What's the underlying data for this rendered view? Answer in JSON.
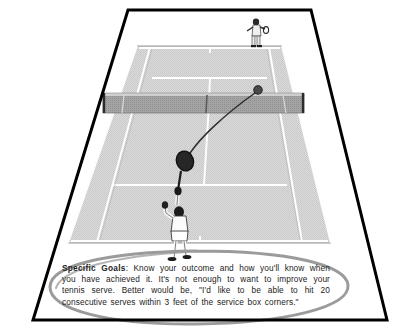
{
  "figure": {
    "kind": "line-art-illustration",
    "background_color": "#ffffff",
    "frame": {
      "shape": "trapezoid-border",
      "color": "#000000",
      "stroke_width": 3
    }
  },
  "court": {
    "surface_color": "#d9d9d9",
    "line_color": "#ffffff",
    "outline_color": "#8c8c8c",
    "net": {
      "name": "tennis-net",
      "band_color": "#9a9a9a",
      "post_color": "#2b2b2b"
    }
  },
  "players": {
    "near": {
      "label": "serving-player",
      "pose": "overhead-serve",
      "skin_color": "#1c1c1c",
      "clothing_color": "#ffffff",
      "racket_color": "#1a1a1a"
    },
    "far": {
      "label": "receiving-player",
      "pose": "standing-ready",
      "clothing_color": "#f0f0f0"
    }
  },
  "ball": {
    "label": "tennis-ball",
    "color": "#3a3a3a",
    "trajectory": "arc-from-racket-over-net"
  },
  "annotation": {
    "ellipse": {
      "label": "hand-drawn-highlight-ellipse",
      "color": "#9e9e9e",
      "stroke_width": 3
    }
  },
  "caption": {
    "lead_label": "Specific Goals",
    "separator": ": ",
    "body": "Know your outcome and how you'll know when you have achieved it. It's not enough to want to improve your tennis serve. Better would be, \"I'd like to be able to hit 20 consecutive serves within 3 feet of the service box corners.\""
  }
}
